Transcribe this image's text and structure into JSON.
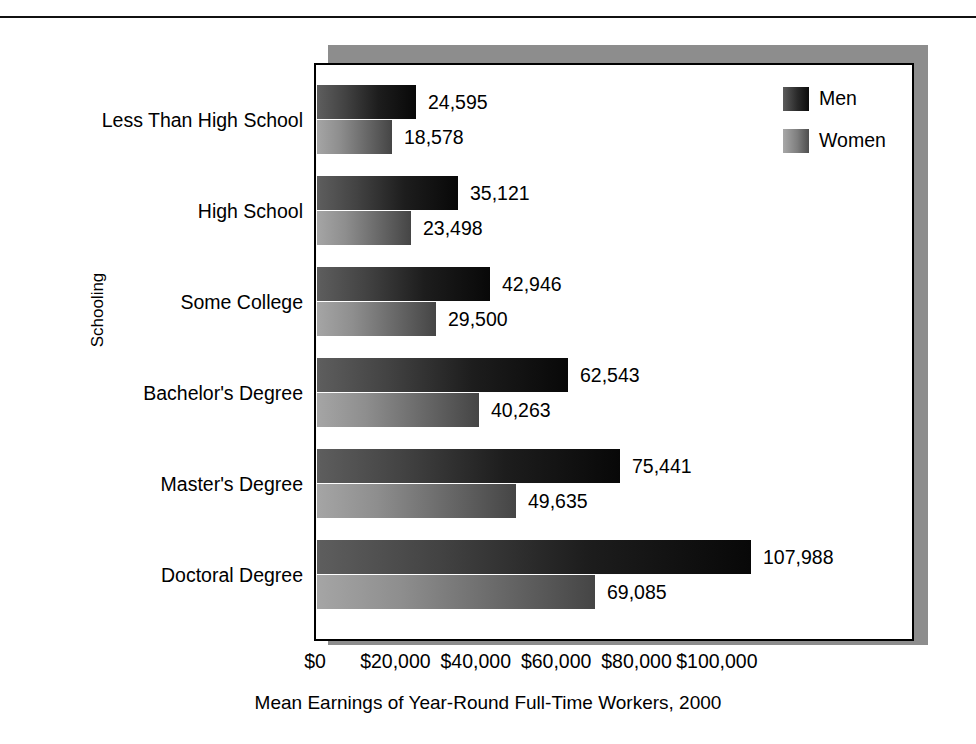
{
  "chart_data": {
    "type": "bar",
    "orientation": "horizontal",
    "title": "",
    "xlabel": "Mean Earnings of Year-Round Full-Time Workers, 2000",
    "ylabel": "Schooling",
    "categories": [
      "Less Than High School",
      "High School",
      "Some College",
      "Bachelor's Degree",
      "Master's Degree",
      "Doctoral Degree"
    ],
    "series": [
      {
        "name": "Men",
        "values": [
          24595,
          35121,
          42946,
          62543,
          75441,
          107988
        ],
        "labels": [
          "24,595",
          "35,121",
          "42,946",
          "62,543",
          "75,441",
          "107,988"
        ],
        "color": "#1d1d1d"
      },
      {
        "name": "Women",
        "values": [
          18578,
          23498,
          29500,
          40263,
          49635,
          69085
        ],
        "labels": [
          "18,578",
          "23,498",
          "29,500",
          "40,263",
          "49,635",
          "69,085"
        ],
        "color": "#8e8e8e"
      }
    ],
    "xticks": [
      0,
      20000,
      40000,
      60000,
      80000,
      100000
    ],
    "xtick_labels": [
      "$0",
      "$20,000",
      "$40,000",
      "$60,000",
      "$80,000",
      "$100,000"
    ],
    "xlim": [
      0,
      118000
    ],
    "grid": false,
    "legend_position": "top-right",
    "legend_entries": [
      "Men",
      "Women"
    ]
  },
  "legend": {
    "men": "Men",
    "women": "Women"
  },
  "axes": {
    "y_title": "Schooling",
    "x_title": "Mean Earnings of Year-Round Full-Time Workers, 2000"
  }
}
